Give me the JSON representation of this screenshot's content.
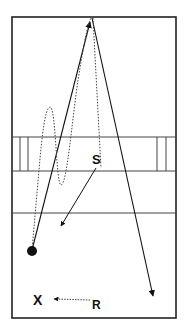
{
  "diagram": {
    "type": "drill-diagram",
    "colors": {
      "background": "#ffffff",
      "ink": "#111111",
      "lines": "#333333"
    },
    "labels": {
      "s": "S",
      "x": "X",
      "r": "R"
    },
    "elements": {
      "field_boundary": "rectangle",
      "bands": [
        "upper-band",
        "lower-line"
      ],
      "ball": "filled-circle",
      "pass_lines": [
        "solid-up-to-top",
        "solid-down-to-right"
      ],
      "run_path": "dotted-wavy",
      "s_arrow": "solid-arrow",
      "r_arrow": "dotted-arrow"
    }
  }
}
